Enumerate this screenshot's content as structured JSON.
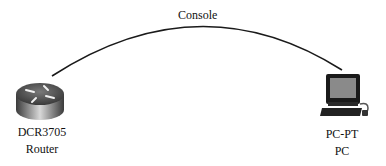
{
  "diagram": {
    "link": {
      "label": "Console",
      "type": "console-cable",
      "color": "#1a1a1a"
    },
    "nodes": [
      {
        "id": "router",
        "name": "DCR3705",
        "type": "Router",
        "icon": "router-icon"
      },
      {
        "id": "pc",
        "name": "PC-PT",
        "type": "PC",
        "icon": "pc-icon"
      }
    ]
  }
}
